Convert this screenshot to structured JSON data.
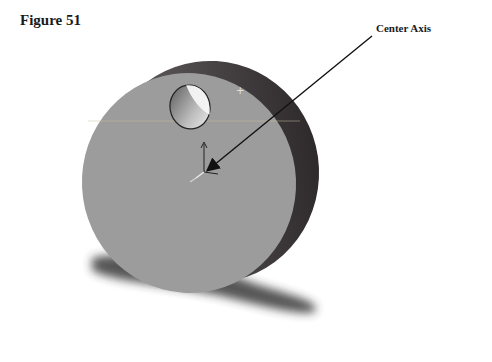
{
  "figure": {
    "title": "Figure 51",
    "callout_label": "Center Axis"
  },
  "model": {
    "shape": "disc with offset through-hole",
    "face_color": "#9c9c9c",
    "rim_color": "#3a3536",
    "hole_inner_color": "#f2f2f2",
    "shadow_color": "#2a2a2a",
    "arrow_color": "#111111"
  },
  "icons": {
    "origin_triad": "coordinate-axis-triad-icon",
    "arrow": "leader-arrow"
  }
}
